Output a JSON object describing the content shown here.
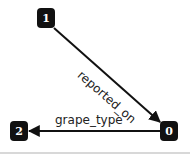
{
  "diagram": {
    "nodes": [
      {
        "id": "1",
        "label": "1"
      },
      {
        "id": "2",
        "label": "2"
      },
      {
        "id": "0",
        "label": "0"
      }
    ],
    "edges": [
      {
        "from": "1",
        "to": "0",
        "label": "reported_on"
      },
      {
        "from": "0",
        "to": "2",
        "label": "grape_type"
      }
    ],
    "colors": {
      "node_fill": "#111111",
      "node_text": "#ffffff",
      "edge": "#111111",
      "background": "#ffffff"
    }
  }
}
